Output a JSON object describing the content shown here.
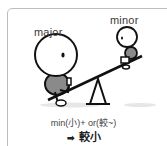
{
  "labels": {
    "major": "major",
    "minor": "minor"
  },
  "formula": "min(小)+ or(較~)",
  "result": {
    "arrow": "➡",
    "text": "較小"
  },
  "colors": {
    "border": "#bdbdbd",
    "body_fill": "#8a8a8a",
    "line": "#111111",
    "shadow": "#e2e2e2"
  }
}
